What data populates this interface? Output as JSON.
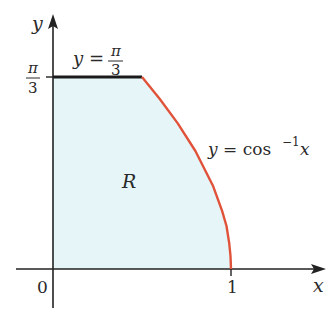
{
  "diagram": {
    "type": "region-plot",
    "axes": {
      "x_label": "x",
      "y_label": "y",
      "origin_label": "0",
      "x_tick_label": "1",
      "y_tick_label_num": "π",
      "y_tick_label_den": "3"
    },
    "region_label": "R",
    "curves": [
      {
        "name": "horizontal-line",
        "label_lhs": "y =",
        "label_num": "π",
        "label_den": "3",
        "color": "#1a1a1a"
      },
      {
        "name": "arccos-curve",
        "label_lhs": "y = cos",
        "label_sup": "−1",
        "label_rhs": "x",
        "color": "#e0533a"
      }
    ],
    "colors": {
      "region_fill": "#e6f6f8",
      "axis": "#222222",
      "curve": "#e0533a",
      "line": "#1a1a1a"
    }
  }
}
